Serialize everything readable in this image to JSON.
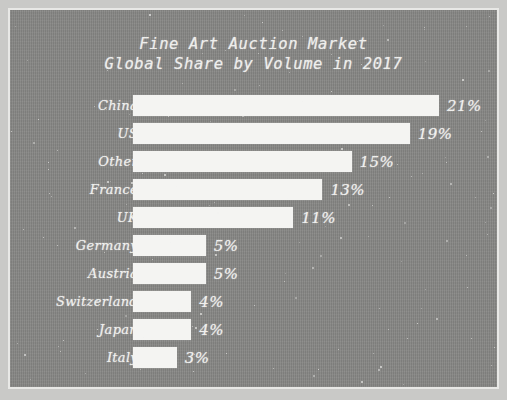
{
  "chart_data": {
    "type": "bar",
    "orientation": "horizontal",
    "title": "Fine Art Auction Market",
    "subtitle": "Global Share by Volume in 2017",
    "xlabel": "",
    "ylabel": "",
    "grid": false,
    "legend": false,
    "xlim": [
      0,
      21
    ],
    "unit": "%",
    "categories": [
      "China",
      "US",
      "Other",
      "France",
      "UK",
      "Germany",
      "Austria",
      "Switzerland",
      "Japan",
      "Italy"
    ],
    "values": [
      21,
      19,
      15,
      13,
      11,
      5,
      5,
      4,
      4,
      3
    ],
    "value_labels": [
      "21%",
      "19%",
      "15%",
      "13%",
      "11%",
      "5%",
      "5%",
      "4%",
      "4%",
      "3%"
    ],
    "colors": {
      "background": "#868684",
      "frame_border": "#e8e8e6",
      "bar": "#f4f4f2",
      "text": "#f0f0ee"
    }
  }
}
